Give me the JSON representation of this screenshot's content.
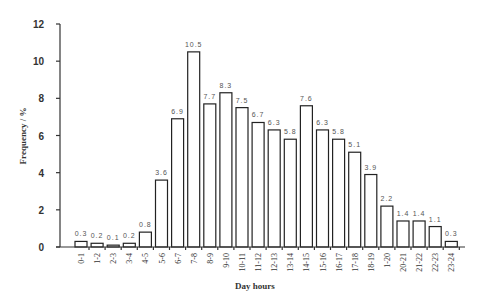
{
  "chart_data": {
    "type": "bar",
    "title": "",
    "xlabel": "Day hours",
    "ylabel": "Frequency / %",
    "ylim": [
      0,
      12
    ],
    "yticks": [
      0,
      2,
      4,
      6,
      8,
      10,
      12
    ],
    "grid": false,
    "legend": null,
    "categories": [
      "0-1",
      "1-2",
      "2-3",
      "3-4",
      "4-5",
      "5-6",
      "6-7",
      "7-8",
      "8-9",
      "9-10",
      "10-11",
      "11-12",
      "12-13",
      "13-14",
      "14-15",
      "15-16",
      "16-17",
      "17-18",
      "18-19",
      "19-20",
      "20-21",
      "21-22",
      "22-23",
      "23-24"
    ],
    "values": [
      0.3,
      0.2,
      0.1,
      0.2,
      0.8,
      3.6,
      6.9,
      10.5,
      7.7,
      8.3,
      7.5,
      6.7,
      6.3,
      5.8,
      7.6,
      6.3,
      5.8,
      5.1,
      3.9,
      2.2,
      1.4,
      1.4,
      1.1,
      0.3
    ],
    "value_labels": [
      "0.3",
      "0.2",
      "0.1",
      "0.2",
      "0.8",
      "3.6",
      "6.9",
      "10.5",
      "7.7",
      "8.3",
      "7.5",
      "6.7",
      "6.3",
      "5.8",
      "7.6",
      "6.3",
      "5.8",
      "5.1",
      "3.9",
      "2.2",
      "1.4",
      "1.4",
      "1.1",
      "0.3"
    ],
    "category_labels_shown": [
      "0-1",
      "1-2",
      "2-3",
      "3-4",
      "4-5",
      "5-6",
      "6-7",
      "7-8",
      "8-9",
      "9-10",
      "10-11",
      "11-12",
      "12-13",
      "13-14",
      "14-15",
      "15-16",
      "16-17",
      "17-18",
      "18-19",
      "1-20",
      "20-21",
      "21-22",
      "22-23",
      "23-24"
    ]
  },
  "axes": {
    "x_title": "Day hours",
    "y_title": "Frequency / %"
  }
}
